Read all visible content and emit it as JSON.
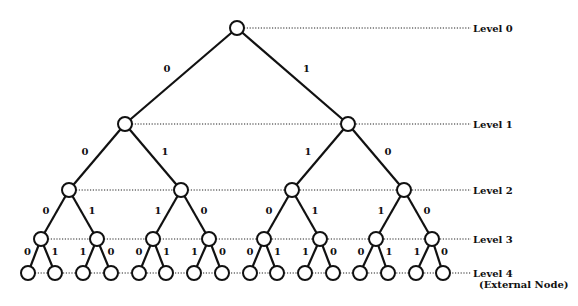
{
  "diagram": {
    "type": "binary-tree",
    "levels": [
      {
        "label": "Level 0",
        "y": 28
      },
      {
        "label": "Level 1",
        "y": 124
      },
      {
        "label": "Level 2",
        "y": 190
      },
      {
        "label": "Level 3",
        "y": 239
      },
      {
        "label": "Level 4",
        "sublabel": "(External Node)",
        "y": 273
      }
    ],
    "level_label_x": 473,
    "node_radius": [
      7,
      7,
      7,
      7,
      7
    ],
    "nodes_x": [
      [
        237
      ],
      [
        125,
        348
      ],
      [
        69,
        181,
        292,
        404
      ],
      [
        41,
        97,
        153,
        209,
        264,
        320,
        376,
        432
      ],
      [
        28,
        55,
        83,
        111,
        139,
        166,
        194,
        222,
        250,
        277,
        305,
        333,
        360,
        388,
        416,
        443
      ]
    ],
    "edge_labels": [
      [
        "0",
        "1"
      ],
      [
        "0",
        "1",
        "1",
        "0"
      ],
      [
        "0",
        "1",
        "1",
        "0",
        "0",
        "1",
        "1",
        "0"
      ],
      [
        "0",
        "1",
        "1",
        "0",
        "0",
        "1",
        "1",
        "0",
        "0",
        "1",
        "1",
        "0",
        "0",
        "1",
        "1",
        "0"
      ]
    ]
  }
}
